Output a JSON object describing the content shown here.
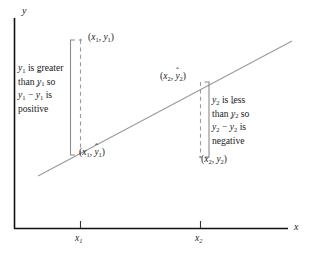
{
  "figure": {
    "type": "scatter-regression-residual-diagram",
    "background_color": "#ffffff",
    "axis_color": "#111111",
    "line_color": "#9a9a9a",
    "dash_color": "#9a9a9a",
    "bracket_color": "#8c8c8c",
    "text_color": "#1a1a1a"
  },
  "axes": {
    "y_label": "y",
    "x_label": "x",
    "x_ticks": [
      {
        "id": "x1",
        "label": "x",
        "sub": "1"
      },
      {
        "id": "x2",
        "label": "x",
        "sub": "2"
      }
    ]
  },
  "points": {
    "observed_1": {
      "x_sym": "x",
      "x_sub": "1",
      "y_sym": "y",
      "y_sub": "1",
      "y_hat": false
    },
    "fitted_1": {
      "x_sym": "x",
      "x_sub": "1",
      "y_sym": "y",
      "y_sub": "1",
      "y_hat": true
    },
    "fitted_2": {
      "x_sym": "x",
      "x_sub": "2",
      "y_sym": "y",
      "y_sub": "2",
      "y_hat": true
    },
    "observed_2": {
      "x_sym": "x",
      "x_sub": "2",
      "y_sym": "y",
      "y_sub": "2",
      "y_hat": false
    }
  },
  "notes": {
    "left": {
      "lines": [
        [
          {
            "t": "y",
            "i": true
          },
          {
            "t": "1",
            "sub": true
          },
          {
            "t": " is greater"
          }
        ],
        [
          {
            "t": "than "
          },
          {
            "t": "y",
            "i": true,
            "hat": true
          },
          {
            "t": "1",
            "sub": true
          },
          {
            "t": " so"
          }
        ],
        [
          {
            "t": "y",
            "i": true
          },
          {
            "t": "1",
            "sub": true
          },
          {
            "t": " − "
          },
          {
            "t": "y",
            "i": true,
            "hat": true
          },
          {
            "t": "1",
            "sub": true
          },
          {
            "t": " is"
          }
        ],
        [
          {
            "t": "positive"
          }
        ]
      ],
      "plain_text": "y1 is greater than ŷ1 so y1 − ŷ1 is positive"
    },
    "right": {
      "lines": [
        [
          {
            "t": "y",
            "i": true
          },
          {
            "t": "2",
            "sub": true
          },
          {
            "t": " is less"
          }
        ],
        [
          {
            "t": "than "
          },
          {
            "t": "y",
            "i": true,
            "hat": true
          },
          {
            "t": "2",
            "sub": true
          },
          {
            "t": " so"
          }
        ],
        [
          {
            "t": "y",
            "i": true
          },
          {
            "t": "2",
            "sub": true
          },
          {
            "t": " − "
          },
          {
            "t": "y",
            "i": true,
            "hat": true
          },
          {
            "t": "2",
            "sub": true
          },
          {
            "t": " is"
          }
        ],
        [
          {
            "t": "negative"
          }
        ]
      ],
      "plain_text": "y2 is less than ŷ2 so y2 − ŷ2 is negative"
    }
  },
  "geometry": {
    "y_axis": {
      "x": 14,
      "y_top": 18,
      "y_bottom": 228
    },
    "x_axis": {
      "y": 228,
      "x_left": 14,
      "x_right": 288
    },
    "regression_line": {
      "x1": 38,
      "y1": 176,
      "x2": 292,
      "y2": 41
    },
    "residual_1": {
      "x": 80,
      "y_top": 40,
      "y_bottom": 155
    },
    "residual_2": {
      "x": 200,
      "y_top": 82,
      "y_bottom": 157
    },
    "bracket_left": {
      "x": 70,
      "y_top": 40,
      "y_bottom": 155,
      "tick": 5
    },
    "bracket_right": {
      "x": 209,
      "y_top": 82,
      "y_bottom": 157,
      "tick": 5
    },
    "tick_x1": {
      "x": 80,
      "y_top": 222,
      "y_bottom": 228
    },
    "tick_x2": {
      "x": 200,
      "y_top": 222,
      "y_bottom": 228
    }
  }
}
